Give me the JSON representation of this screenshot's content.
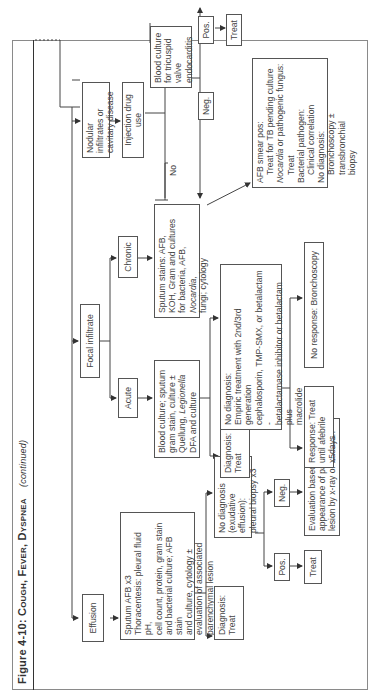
{
  "figure": {
    "title_prefix": "Figure 4-10:",
    "title_main": "Cough, Fever, Dyspnea",
    "title_suffix": "(continued)"
  },
  "nodes": {
    "effusion": "Effusion",
    "focal_infiltrate": "Focal infiltrate",
    "nodular": "Nodular infiltrates or cavitary disease",
    "injection_drug_use": "Injection drug use",
    "blood_culture_endocarditis": "Blood culture for tricuspid valve endocarditis",
    "endo_pos": "Pos.",
    "endo_neg": "Neg.",
    "endo_treat": "Treat",
    "acute": "Acute",
    "chronic": "Chronic",
    "acute_workup": [
      "Blood culture; sputum",
      "gram stain, culture ±",
      "Quellung, ",
      "Legionella",
      "DFA and culture"
    ],
    "chronic_workup": [
      "Sputum stains: AFB,",
      "KOH, Gram and cultures",
      "for bacteria, AFB, ",
      "Nocardia,",
      "fungi; cytology"
    ],
    "acute_diagnosis": "Diagnosis: Treat",
    "acute_no_diagnosis": [
      "No diagnosis:",
      "Empiric treatment with 2nd/3rd generation",
      "cephalosporin, TMP-SMX, or betalactam -",
      "betalactamase inhibitor or betalactam plus",
      "macrolide"
    ],
    "response": "Response: Treat until afebrile x5days",
    "no_response": "No response: Bronchoscopy",
    "chronic_results": {
      "afb_pos": "AFB smear pos:",
      "afb_pos_action": "Treat for TB pending culture",
      "nocardia": "Nocardia",
      "nocardia_rest": " or pathogenic fungus:",
      "nocardia_action": "Treat",
      "bacterial": "Bacterial pathogen:",
      "bacterial_action": "Clinical correlation",
      "no_dx": "No diagnosis:",
      "no_dx_action": "Bronchoscopy ± transbronchial",
      "no_dx_action2": "biopsy"
    },
    "effusion_workup": [
      "Sputum AFB x3",
      "Thoracentesis: pleural fluid pH,",
      "cell count, protein, gram stain",
      "and bacterial culture; AFB stain",
      "and culture, cytology ±",
      "evaluation of associated",
      "parenchymal lesion"
    ],
    "effusion_diagnosis": "Diagnosis: Treat",
    "effusion_no_diagnosis": [
      "No diagnosis",
      "(exudative effusion):",
      "pleural biopsy x3"
    ],
    "biopsy_pos": "Pos.",
    "biopsy_neg": "Neg.",
    "biopsy_treat": "Treat",
    "biopsy_neg_eval": [
      "Evaluation based on",
      "appearance of parenchymal",
      "lesion by x-ray or CT scan"
    ]
  },
  "edge_labels": {
    "yes": "Yes",
    "no": "No"
  },
  "colors": {
    "line": "#444444",
    "border": "#555555",
    "text": "#444444",
    "frame": "#8a8a8a"
  }
}
